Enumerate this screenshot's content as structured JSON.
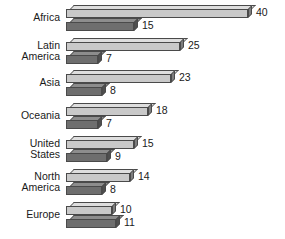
{
  "chart_data": {
    "type": "bar",
    "orientation": "horizontal",
    "title": "",
    "subtitle": "",
    "xlabel": "",
    "ylabel": "",
    "grid": false,
    "legend": "none",
    "xlim": [
      0,
      40
    ],
    "categories": [
      "Africa",
      "Latin\nAmerica",
      "Asia",
      "Oceania",
      "United\nStates",
      "North\nAmerica",
      "Europe"
    ],
    "series": [
      {
        "name": "series-light",
        "color": "#c9c9c9",
        "values": [
          40,
          25,
          23,
          18,
          15,
          14,
          10
        ]
      },
      {
        "name": "series-dark",
        "color": "#6e6e6e",
        "values": [
          15,
          7,
          8,
          7,
          9,
          8,
          11
        ]
      }
    ],
    "data_labels": [
      {
        "category": "Africa",
        "light": "40",
        "dark": "15"
      },
      {
        "category": "Latin America",
        "light": "25",
        "dark": "7"
      },
      {
        "category": "Asia",
        "light": "23",
        "dark": "8"
      },
      {
        "category": "Oceania",
        "light": "18",
        "dark": "7"
      },
      {
        "category": "United States",
        "light": "15",
        "dark": "9"
      },
      {
        "category": "North America",
        "light": "14",
        "dark": "8"
      },
      {
        "category": "Europe",
        "light": "10",
        "dark": "11"
      }
    ]
  },
  "groups": [
    {
      "label": "Africa",
      "light": {
        "value": 40,
        "label": "40"
      },
      "dark": {
        "value": 15,
        "label": "15"
      }
    },
    {
      "label": "Latin\nAmerica",
      "light": {
        "value": 25,
        "label": "25"
      },
      "dark": {
        "value": 7,
        "label": "7"
      }
    },
    {
      "label": "Asia",
      "light": {
        "value": 23,
        "label": "23"
      },
      "dark": {
        "value": 8,
        "label": "8"
      }
    },
    {
      "label": "Oceania",
      "light": {
        "value": 18,
        "label": "18"
      },
      "dark": {
        "value": 7,
        "label": "7"
      }
    },
    {
      "label": "United\nStates",
      "light": {
        "value": 15,
        "label": "15"
      },
      "dark": {
        "value": 9,
        "label": "9"
      }
    },
    {
      "label": "North\nAmerica",
      "light": {
        "value": 14,
        "label": "14"
      },
      "dark": {
        "value": 8,
        "label": "8"
      }
    },
    {
      "label": "Europe",
      "light": {
        "value": 10,
        "label": "10"
      },
      "dark": {
        "value": 11,
        "label": "11"
      }
    }
  ],
  "colors": {
    "light_bar": "#c9c9c9",
    "dark_bar": "#6e6e6e",
    "outline": "#4a4a4a",
    "text": "#1a1a1a",
    "background": "#ffffff"
  }
}
